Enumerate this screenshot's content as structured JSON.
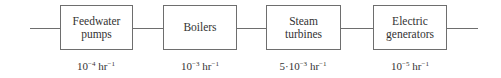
{
  "diagram": {
    "type": "series reliability block diagram",
    "components": [
      {
        "label_lines": [
          "Feedwater",
          "pumps"
        ],
        "rate": {
          "coef": "",
          "base": "10",
          "exp": "−4",
          "unit": " hr",
          "unit_exp": "−1"
        }
      },
      {
        "label_lines": [
          "Boilers"
        ],
        "rate": {
          "coef": "",
          "base": "10",
          "exp": "−3",
          "unit": " hr",
          "unit_exp": "−1"
        }
      },
      {
        "label_lines": [
          "Steam",
          "turbines"
        ],
        "rate": {
          "coef": "5·",
          "base": "10",
          "exp": "−3",
          "unit": " hr",
          "unit_exp": "−1"
        }
      },
      {
        "label_lines": [
          "Electric",
          "generators"
        ],
        "rate": {
          "coef": "",
          "base": "10",
          "exp": "−5",
          "unit": " hr",
          "unit_exp": "−1"
        }
      }
    ],
    "colors": {
      "line": "#6e6e6e",
      "text": "#333333",
      "background": "#ffffff"
    }
  }
}
